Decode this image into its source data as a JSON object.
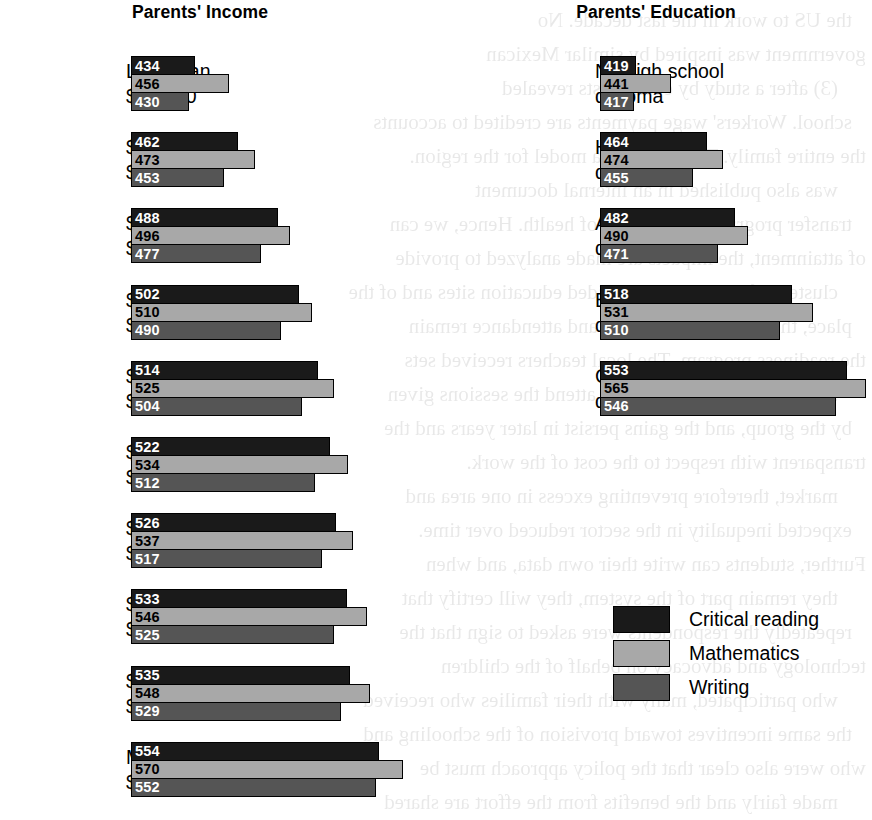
{
  "legend": {
    "items": [
      {
        "key": "critical_reading",
        "label": "Critical reading",
        "color": "#1a1a1a",
        "swatch": "swatch-cr"
      },
      {
        "key": "mathematics",
        "label": "Mathematics",
        "color": "#a8a8a8",
        "swatch": "swatch-ma"
      },
      {
        "key": "writing",
        "label": "Writing",
        "color": "#555555",
        "swatch": "swatch-wr"
      }
    ]
  },
  "chart_data": [
    {
      "type": "bar",
      "orientation": "horizontal",
      "title": "Parents' Income",
      "xlabel": "",
      "ylabel": "",
      "grid": false,
      "legend_position": "bottom-right",
      "axis_baseline_value": 392,
      "value_labels": true,
      "categories": [
        [
          "Less than",
          "$20,000"
        ],
        [
          "$20,000–",
          "$40,000"
        ],
        [
          "$40,000–",
          "$60,000"
        ],
        [
          "$60,000–",
          "$80,000"
        ],
        [
          "$80,000–",
          "$100,000"
        ],
        [
          "$100,000–",
          "$120,000"
        ],
        [
          "$120,000–",
          "$140,000"
        ],
        [
          "$140,000–",
          "$160,000"
        ],
        [
          "$160,000–",
          "$200,000"
        ],
        [
          "More than",
          "$200,000"
        ]
      ],
      "series": [
        {
          "name": "Critical reading",
          "values": [
            434,
            462,
            488,
            502,
            514,
            522,
            526,
            533,
            535,
            554
          ]
        },
        {
          "name": "Mathematics",
          "values": [
            456,
            473,
            496,
            510,
            525,
            534,
            537,
            546,
            548,
            570
          ]
        },
        {
          "name": "Writing",
          "values": [
            430,
            453,
            477,
            490,
            504,
            512,
            517,
            525,
            529,
            552
          ]
        }
      ]
    },
    {
      "type": "bar",
      "orientation": "horizontal",
      "title": "Parents' Education",
      "xlabel": "",
      "ylabel": "",
      "grid": false,
      "legend_position": "bottom-right",
      "axis_baseline_value": 396,
      "value_labels": true,
      "categories": [
        [
          "No high school",
          "diploma"
        ],
        [
          "High school",
          "diploma"
        ],
        [
          "Associate",
          "degree"
        ],
        [
          "Bachelor's",
          "degree"
        ],
        [
          "Graduate",
          "degree"
        ]
      ],
      "series": [
        {
          "name": "Critical reading",
          "values": [
            419,
            464,
            482,
            518,
            553
          ]
        },
        {
          "name": "Mathematics",
          "values": [
            441,
            474,
            490,
            531,
            565
          ]
        },
        {
          "name": "Writing",
          "values": [
            417,
            455,
            471,
            510,
            546
          ]
        }
      ]
    }
  ],
  "ghost_text": [
    "the US to work in the last decade. No",
    "government was inspired by similar Mexican",
    "(3) after a study by economists revealed",
    "school. Workers' wage payments are credited to accounts",
    "the entire family. The school is a model for the region.",
    "was also published in an internal document",
    "transfer programs in the areas of health. Hence, we can",
    "of attainment, the impacts are made analyzed to provide",
    "clusters of schools and provided education sites and of the",
    "place, the incentives for work and attendance remain",
    "the readiness program. The local teachers received sets",
    "support from the ministry to attend the sessions given",
    "by the group, and the gains persist in later years and the",
    "transparent with respect to the cost of the work.",
    "market, therefore preventing excess in one area and",
    "expected inequality in the sector reduced over time.",
    "Further, students can write their own data, and when",
    "they remain part of the system, they will certify that",
    "repeatedly the respondents were asked to sign that the",
    "technology and advocacy on behalf of the children",
    "who participated, many with their families who received",
    "the same incentives toward provision of the schooling and",
    "who were also clear that the policy approach must be",
    "made fairly and the benefits from the effort are shared"
  ]
}
